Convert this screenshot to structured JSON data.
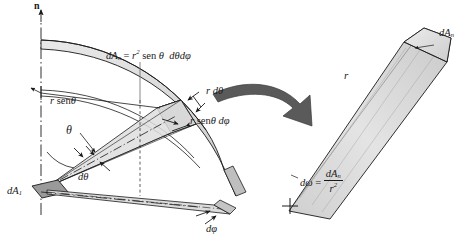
{
  "figure": {
    "background": "#ffffff",
    "width": 468,
    "height": 247,
    "ink": "#1a1a1a",
    "surface_fill": "#d8d8d8",
    "surface_fill_light": "#e8e8e8",
    "cone_fill": "#dcdcdc",
    "arrow_fill": "#4a4a4a",
    "patch_fill": "#9a9a9a"
  },
  "left_panel": {
    "axis_label": "n",
    "area_formula": {
      "lhs": "dA",
      "lhs_sub": "n",
      "eq": "=",
      "r": "r",
      "r_exp": "2",
      "sin_fn": "sen",
      "theta": "θ",
      "dtheta": "dθ",
      "dphi": "dφ",
      "full": "dAₙ = r² sen θ dθ dφ"
    },
    "labels": {
      "r_sin_theta": {
        "r": "r",
        "fn": "sen",
        "theta": "θ",
        "full": "r sen θ"
      },
      "r_dtheta": {
        "r": "r",
        "d": "d",
        "theta": "θ",
        "full": "r dθ"
      },
      "r_sin_theta_dphi": {
        "r": "r",
        "fn": "sen",
        "theta": "θ",
        "dphi": "dφ",
        "full": "r sen θ dφ"
      },
      "theta": "θ",
      "dtheta": "dθ",
      "dphi": "dφ",
      "dA1": {
        "base": "dA",
        "sub": "1",
        "full": "dA₁"
      }
    }
  },
  "right_panel": {
    "cone_radius_label": "r",
    "cap_label": {
      "base": "dA",
      "sub": "n",
      "full": "dAₙ"
    },
    "solid_angle_formula": {
      "lhs": "dω",
      "eq": "=",
      "num": "dA",
      "num_sub": "n",
      "den": "r",
      "den_exp": "2",
      "full": "dω = dAₙ / r²"
    }
  },
  "connector": {
    "arrow_name": "transformation-arrow"
  }
}
